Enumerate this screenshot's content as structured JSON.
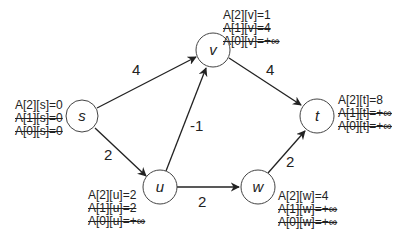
{
  "diagram": {
    "type": "graph",
    "title": "",
    "colors": {
      "stroke": "#222222",
      "node_fill": "#ffffff",
      "text": "#222222"
    },
    "nodes": [
      {
        "id": "s",
        "label": "s",
        "x": 82,
        "y": 116,
        "annotations": [
          {
            "text": "A[2][s]=0",
            "struck": false
          },
          {
            "text": "A[1][s]=0",
            "struck": true
          },
          {
            "text": "A[0][s]=0",
            "struck": true
          }
        ]
      },
      {
        "id": "v",
        "label": "v",
        "x": 213,
        "y": 50,
        "annotations": [
          {
            "text": "A[2][v]=1",
            "struck": false
          },
          {
            "text": "A[1][v]=4",
            "struck": true
          },
          {
            "text": "A[0][v]=+∞",
            "struck": true
          }
        ]
      },
      {
        "id": "t",
        "label": "t",
        "x": 317,
        "y": 116,
        "annotations": [
          {
            "text": "A[2][t]=8",
            "struck": false
          },
          {
            "text": "A[1][t]=+∞",
            "struck": true
          },
          {
            "text": "A[0][t]=+∞",
            "struck": true
          }
        ]
      },
      {
        "id": "u",
        "label": "u",
        "x": 160,
        "y": 187,
        "annotations": [
          {
            "text": "A[2][u]=2",
            "struck": false
          },
          {
            "text": "A[1][u]=2",
            "struck": true
          },
          {
            "text": "A[0][u]=+∞",
            "struck": true
          }
        ]
      },
      {
        "id": "w",
        "label": "w",
        "x": 258,
        "y": 187,
        "annotations": [
          {
            "text": "A[2][w]=4",
            "struck": false
          },
          {
            "text": "A[1][w]=+∞",
            "struck": true
          },
          {
            "text": "A[0][w]=+∞",
            "struck": true
          }
        ]
      }
    ],
    "edges": [
      {
        "from": "s",
        "to": "v",
        "weight": "4"
      },
      {
        "from": "s",
        "to": "u",
        "weight": "2"
      },
      {
        "from": "u",
        "to": "v",
        "weight": "-1"
      },
      {
        "from": "v",
        "to": "t",
        "weight": "4"
      },
      {
        "from": "u",
        "to": "w",
        "weight": "2"
      },
      {
        "from": "w",
        "to": "t",
        "weight": "2"
      }
    ]
  }
}
